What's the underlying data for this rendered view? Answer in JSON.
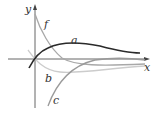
{
  "figure": {
    "type": "function-graphs",
    "axes": {
      "x_label": "x",
      "y_label": "y"
    },
    "curves": [
      {
        "label": "f",
        "description": "decreasing from top-left, crossing x-axis and approaching slightly below 0",
        "color": "#a8a8a8"
      },
      {
        "label": "a",
        "description": "rises from below origin through origin, peaks, decays toward 0",
        "color": "#2a2a2a"
      },
      {
        "label": "b",
        "description": "dips below x-axis near origin then approaches 0 from below",
        "color": "#c8c8c8"
      },
      {
        "label": "c",
        "description": "rises from far below toward 0",
        "color": "#9a9a9a"
      }
    ],
    "colors": {
      "axis": "#555555",
      "background": "#ffffff"
    }
  }
}
